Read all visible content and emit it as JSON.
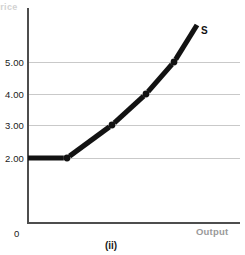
{
  "figure": {
    "caption": "(ii)",
    "background": "#ffffff"
  },
  "axes": {
    "y_title": "Price",
    "x_title": "Output",
    "origin_label": "0",
    "y_ticks": [
      {
        "label": "5.00",
        "value": 5.0,
        "top": 57
      },
      {
        "label": "4.00",
        "value": 4.0,
        "top": 89
      },
      {
        "label": "3.00",
        "value": 3.0,
        "top": 120
      },
      {
        "label": "2.00",
        "value": 2.0,
        "top": 153
      }
    ],
    "gridlines": [
      62,
      94,
      125,
      158
    ],
    "axis_color": "#4d4d4d",
    "grid_color": "#c9c9c9"
  },
  "series": {
    "label": "S",
    "color": "#121212"
  },
  "chart_data": {
    "type": "line",
    "title": "",
    "subtitle": "",
    "xlabel": "Output",
    "ylabel": "Price",
    "grid": true,
    "legend_position": "inline-right",
    "annotations": [
      {
        "text": "S",
        "x_px": 203,
        "y_px": 32
      },
      {
        "text": "(ii)",
        "x_px": 110,
        "y_px": 247
      }
    ],
    "ytick_labels": [
      "2.00",
      "3.00",
      "4.00",
      "5.00"
    ],
    "ytick_values": [
      2.0,
      3.0,
      4.0,
      5.0
    ],
    "xtick_labels": [],
    "ylim": [
      0,
      6.0
    ],
    "xlim": [
      0,
      10
    ],
    "series": [
      {
        "name": "S",
        "description": "Stepwise/segmented upward-sloping supply curve",
        "points": [
          {
            "x_px": 28,
            "y_px": 158,
            "price": 2.0,
            "marker": false
          },
          {
            "x_px": 67,
            "y_px": 158,
            "price": 2.0,
            "marker": true
          },
          {
            "x_px": 112,
            "y_px": 125,
            "price": 3.0,
            "marker": true
          },
          {
            "x_px": 146,
            "y_px": 94,
            "price": 4.0,
            "marker": true
          },
          {
            "x_px": 174,
            "y_px": 62,
            "price": 5.0,
            "marker": true
          },
          {
            "x_px": 197,
            "y_px": 25,
            "price": 6.2,
            "marker": false
          }
        ]
      }
    ]
  }
}
